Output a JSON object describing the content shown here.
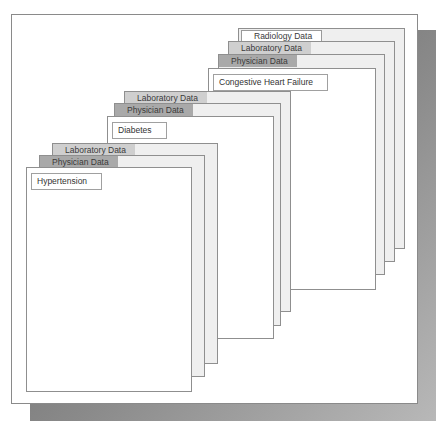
{
  "diagram": {
    "groups": [
      {
        "condition": "Hypertension",
        "layers": [
          "Laboratory Data",
          "Physician Data"
        ]
      },
      {
        "condition": "Diabetes",
        "layers": [
          "Laboratory Data",
          "Physician Data"
        ]
      },
      {
        "condition": "Congestive Heart Failure",
        "layers": [
          "Radiology Data",
          "Laboratory Data",
          "Physician Data"
        ]
      }
    ]
  }
}
